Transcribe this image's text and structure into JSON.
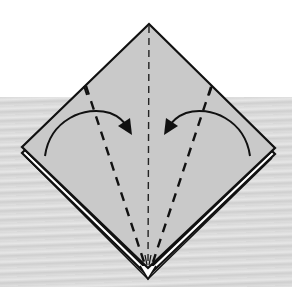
{
  "diagram": {
    "colors": {
      "paper": "#c9c9c9",
      "outline": "#111111",
      "edge_white": "#ffffff",
      "background_top": "#ffffff",
      "background_bottom": "#dcdcdc"
    },
    "elements": [
      {
        "type": "square-base",
        "description": "diamond-shaped folded paper with layered bottom edges"
      },
      {
        "type": "valley-fold-line",
        "position": "center"
      },
      {
        "type": "valley-fold-line",
        "position": "left"
      },
      {
        "type": "valley-fold-line",
        "position": "right"
      },
      {
        "type": "fold-arrow",
        "direction": "left-to-center"
      },
      {
        "type": "fold-arrow",
        "direction": "right-to-center"
      }
    ]
  }
}
